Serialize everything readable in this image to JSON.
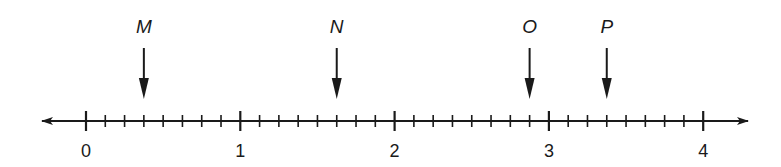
{
  "diagram": {
    "type": "number_line",
    "axis": {
      "min": 0,
      "max": 4,
      "subdivisions_per_unit": 8,
      "major_labels": [
        "0",
        "1",
        "2",
        "3",
        "4"
      ],
      "arrows_both_ends": true
    },
    "points": [
      {
        "label": "M",
        "value": 0.375
      },
      {
        "label": "N",
        "value": 1.625
      },
      {
        "label": "O",
        "value": 2.875
      },
      {
        "label": "P",
        "value": 3.375
      }
    ],
    "colors": {
      "ink": "#1a1a1a",
      "background": "#ffffff"
    }
  }
}
